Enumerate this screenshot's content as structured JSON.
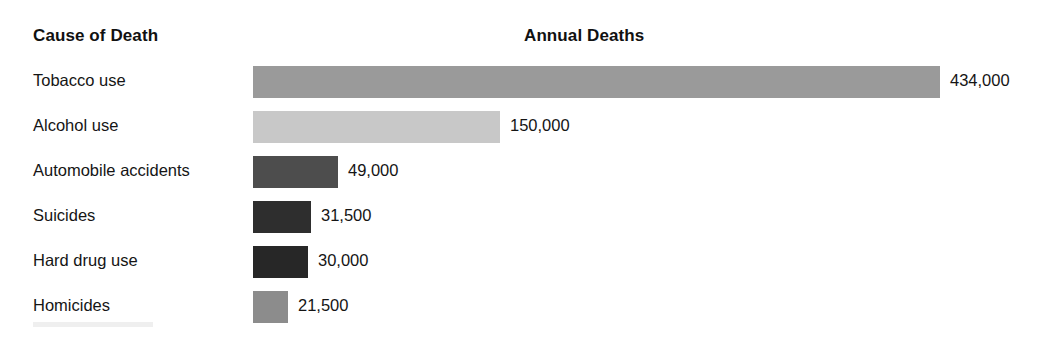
{
  "header": {
    "category_heading": "Cause of Death",
    "value_heading": "Annual Deaths"
  },
  "chart_data": {
    "type": "bar",
    "orientation": "horizontal",
    "title": "",
    "xlabel": "Annual Deaths",
    "ylabel": "Cause of Death",
    "grid": false,
    "legend": "none",
    "xlim": [
      0,
      434000
    ],
    "categories": [
      "Tobacco use",
      "Alcohol use",
      "Automobile accidents",
      "Suicides",
      "Hard drug use",
      "Homicides"
    ],
    "values": [
      434000,
      150000,
      49000,
      31500,
      30000,
      21500
    ],
    "value_labels": [
      "434,000",
      "150,000",
      "49,000",
      "31,500",
      "30,000",
      "21,500"
    ],
    "bar_colors": [
      "#9a9a9a",
      "#c8c8c8",
      "#4d4d4d",
      "#2e2e2e",
      "#272727",
      "#8c8c8c"
    ],
    "bars": [
      {
        "label": "Tobacco use",
        "value": 434000,
        "value_label": "434,000",
        "color": "#9a9a9a",
        "width_px": 687
      },
      {
        "label": "Alcohol use",
        "value": 150000,
        "value_label": "150,000",
        "color": "#c8c8c8",
        "width_px": 247
      },
      {
        "label": "Automobile accidents",
        "value": 49000,
        "value_label": "49,000",
        "color": "#4d4d4d",
        "width_px": 85
      },
      {
        "label": "Suicides",
        "value": 31500,
        "value_label": "31,500",
        "color": "#2e2e2e",
        "width_px": 58
      },
      {
        "label": "Hard drug use",
        "value": 30000,
        "value_label": "30,000",
        "color": "#272727",
        "width_px": 55
      },
      {
        "label": "Homicides",
        "value": 21500,
        "value_label": "21,500",
        "color": "#8c8c8c",
        "width_px": 35
      }
    ]
  }
}
